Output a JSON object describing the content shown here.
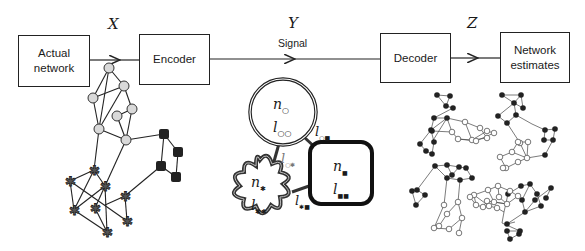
{
  "blocks": {
    "actual_network": "Actual network",
    "encoder": "Encoder",
    "decoder": "Decoder",
    "network_estimates": "Network estimates"
  },
  "variables": {
    "x": "X",
    "y": "Y",
    "z": "Z"
  },
  "signal_label": "Signal",
  "groups": [
    {
      "name": "circle-group",
      "n": "n",
      "l": "l",
      "n_sub": "○",
      "l_sub": "○○"
    },
    {
      "name": "star-group",
      "n": "n",
      "l": "l",
      "n_sub": "✱",
      "l_sub": "✱✱"
    },
    {
      "name": "square-group",
      "n": "n",
      "l": "l",
      "n_sub": "■",
      "l_sub": "■■"
    }
  ],
  "edge_labels": {
    "circle_square": {
      "l": "l",
      "sub": "○■"
    },
    "circle_star": {
      "l": "l",
      "sub": "○✱"
    },
    "star_square": {
      "l": "l",
      "sub": "✱■"
    }
  },
  "colors": {
    "line": "#222222",
    "circle_node": "#d9d9d9",
    "star_node": "#555555",
    "square_node": "#222222"
  }
}
